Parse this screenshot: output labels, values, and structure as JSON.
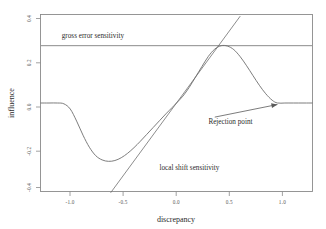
{
  "chart_data": {
    "type": "line",
    "title": "",
    "xlabel": "discrepancy",
    "ylabel": "influence",
    "xlim": [
      -1.28,
      1.28
    ],
    "ylim": [
      -0.44,
      0.44
    ],
    "grid": false,
    "legend": "none",
    "xticks": [
      "-1.0",
      "-0.5",
      "0.0",
      "0.5",
      "1.0"
    ],
    "xtick_values": [
      -1.0,
      -0.5,
      0.0,
      0.5,
      1.0
    ],
    "yticks": [
      "0.4",
      "0.2",
      "0.0",
      "-0.2",
      "-0.4"
    ],
    "ytick_values": [
      0.4,
      0.2,
      0.0,
      -0.2,
      -0.4
    ],
    "series": [
      {
        "name": "influence function",
        "comment": "redescending psi / influence curve, zero outside the rejection point",
        "x": [
          -1.28,
          -1.2,
          -1.12,
          -1.06,
          -1.0,
          -0.94,
          -0.88,
          -0.82,
          -0.76,
          -0.7,
          -0.64,
          -0.58,
          -0.52,
          -0.46,
          -0.4,
          -0.34,
          -0.28,
          -0.22,
          -0.16,
          -0.1,
          -0.04,
          0.0,
          0.06,
          0.12,
          0.18,
          0.24,
          0.3,
          0.36,
          0.42,
          0.48,
          0.54,
          0.6,
          0.66,
          0.72,
          0.78,
          0.84,
          0.9,
          0.95,
          1.02,
          1.1,
          1.2,
          1.28
        ],
        "y": [
          0.0,
          0.0,
          0.0,
          -0.004,
          -0.03,
          -0.09,
          -0.16,
          -0.22,
          -0.262,
          -0.283,
          -0.29,
          -0.286,
          -0.272,
          -0.25,
          -0.222,
          -0.19,
          -0.156,
          -0.122,
          -0.088,
          -0.054,
          -0.022,
          0.0,
          0.034,
          0.078,
          0.13,
          0.182,
          0.232,
          0.268,
          0.285,
          0.283,
          0.265,
          0.23,
          0.185,
          0.136,
          0.088,
          0.046,
          0.014,
          0.0,
          0.0,
          0.0,
          0.0,
          0.0
        ]
      }
    ],
    "reference_lines": [
      {
        "name": "gross error sensitivity",
        "orientation": "horizontal",
        "value": 0.285,
        "label": "gross error sensitivity",
        "label_x": -1.08,
        "label_y": 0.325
      },
      {
        "name": "local shift sensitivity",
        "orientation": "tangent-at-origin",
        "slope": 0.72,
        "x_start": -0.62,
        "x_end": 0.6,
        "label": "local shift sensitivity",
        "label_x": -0.16,
        "label_y": -0.335
      }
    ],
    "annotations": [
      {
        "name": "rejection-point",
        "label": "Rejection point",
        "label_x": 0.3,
        "label_y": -0.105,
        "target_x": 0.95,
        "target_y": 0.0
      }
    ]
  },
  "axes": {
    "x_title": "discrepancy",
    "y_title": "influence",
    "x_tick_labels": [
      "-1.0",
      "-0.5",
      "0.0",
      "0.5",
      "1.0"
    ],
    "y_tick_labels": [
      "0.4",
      "0.2",
      "0.0",
      "-0.2",
      "-0.4"
    ]
  },
  "labels": {
    "gross_error_sensitivity": "gross error sensitivity",
    "local_shift_sensitivity": "local shift sensitivity",
    "rejection_point": "Rejection point"
  },
  "colors": {
    "background": "#ffffff",
    "frame": "#8a8a8a",
    "curve": "#6e6e6e",
    "text": "#2b2b2b",
    "tick_text": "#555555"
  }
}
